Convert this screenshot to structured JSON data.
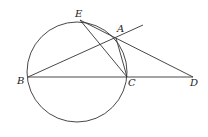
{
  "diagram": {
    "type": "geometry",
    "circle": {
      "cx": 77,
      "cy": 72,
      "r": 50
    },
    "points": {
      "A": {
        "x": 116,
        "y": 38,
        "label": "A",
        "lx": 117,
        "ly": 32
      },
      "B": {
        "x": 28,
        "y": 77,
        "label": "B",
        "lx": 17,
        "ly": 84
      },
      "C": {
        "x": 127,
        "y": 77,
        "label": "C",
        "lx": 128,
        "ly": 86
      },
      "D": {
        "x": 193,
        "y": 77,
        "label": "D",
        "lx": 190,
        "ly": 86
      },
      "E": {
        "x": 80,
        "y": 20,
        "label": "E",
        "lx": 75,
        "ly": 17
      }
    },
    "segments": [
      [
        "B",
        "D"
      ],
      [
        "B",
        "A_ext"
      ],
      [
        "E",
        "D"
      ],
      [
        "E",
        "C"
      ],
      [
        "A",
        "C"
      ]
    ],
    "A_ext": {
      "x": 143,
      "y": 25
    },
    "stroke_color": "#333333"
  }
}
